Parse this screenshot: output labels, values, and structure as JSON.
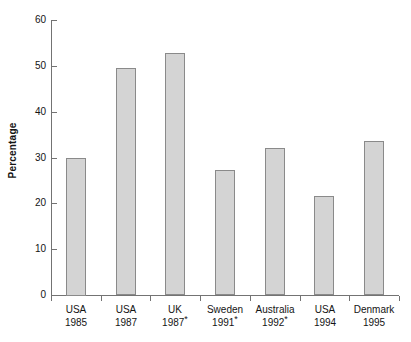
{
  "chart_data": {
    "type": "bar",
    "title": "",
    "subtitle": "",
    "xlabel": "",
    "ylabel": "Percentage",
    "categories": [
      "USA 1985",
      "USA 1987",
      "UK 1987*",
      "Sweden 1991*",
      "Australia 1992*",
      "USA 1994",
      "Denmark 1995"
    ],
    "category_lines": [
      {
        "country": "USA",
        "year": "1985",
        "footnote": ""
      },
      {
        "country": "USA",
        "year": "1987",
        "footnote": ""
      },
      {
        "country": "UK",
        "year": "1987",
        "footnote": "*"
      },
      {
        "country": "Sweden",
        "year": "1991",
        "footnote": "*"
      },
      {
        "country": "Australia",
        "year": "1992",
        "footnote": "*"
      },
      {
        "country": "USA",
        "year": "1994",
        "footnote": ""
      },
      {
        "country": "Denmark",
        "year": "1995",
        "footnote": ""
      }
    ],
    "values": [
      30.0,
      49.5,
      52.8,
      27.2,
      32.1,
      21.6,
      33.7
    ],
    "ylim": [
      0,
      60
    ],
    "ytick_values": [
      0,
      10,
      20,
      30,
      40,
      50,
      60
    ],
    "ytick_labels": [
      "0",
      "10",
      "20",
      "30",
      "40",
      "50",
      "60"
    ],
    "grid": false,
    "legend": null,
    "legend_position": "none",
    "bar_fill_color": "#d4d4d4",
    "bar_edge_color": "#8a8a8a",
    "axis_color": "#737373",
    "background_color": "#ffffff",
    "text_color": "#141414"
  }
}
